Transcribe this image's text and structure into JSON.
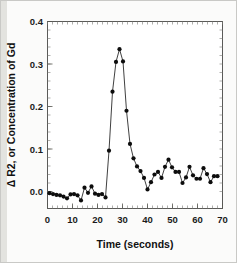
{
  "figure": {
    "background_color": "#fbfbfa",
    "border_color": "#c9c9c6",
    "gutter_color": "#e3e3df",
    "plot_background": "#ffffff"
  },
  "chart_data": {
    "type": "line",
    "title": "",
    "subtitle": "",
    "xlabel": "Time (seconds)",
    "ylabel": "Δ R2, or Concentration of Gd",
    "xlim": [
      0,
      70
    ],
    "ylim": [
      -0.04,
      0.4
    ],
    "xticks": [
      0,
      10,
      20,
      30,
      40,
      50,
      60,
      70
    ],
    "xticklabels": [
      "0",
      "10",
      "20",
      "30",
      "40",
      "50",
      "60",
      "70"
    ],
    "yticks": [
      0.0,
      0.1,
      0.2,
      0.3,
      0.4
    ],
    "yticklabels": [
      "0.0",
      "0.1",
      "0.2",
      "0.3",
      "0.4"
    ],
    "x_minor_tick_interval": 2,
    "y_minor_tick_interval": 0.02,
    "grid": true,
    "grid_axis": "y",
    "legend": false,
    "legend_position": "none",
    "marker": "circle",
    "marker_color": "#0d0d0d",
    "line_color": "#1d1d1d",
    "series": [
      {
        "name": "Δ R2 signal",
        "x": [
          0.8,
          2.2,
          3.6,
          5.0,
          6.4,
          7.8,
          9.2,
          10.6,
          12.0,
          13.4,
          14.8,
          16.2,
          17.6,
          19.0,
          20.4,
          21.8,
          23.2,
          24.6,
          26.0,
          27.4,
          28.8,
          30.2,
          31.6,
          33.0,
          34.4,
          35.8,
          37.2,
          38.6,
          40.0,
          41.4,
          42.8,
          44.2,
          45.6,
          47.0,
          48.4,
          49.8,
          51.2,
          52.6,
          54.0,
          55.4,
          56.8,
          58.2,
          59.6,
          61.0,
          62.4,
          63.8,
          65.2,
          66.6,
          68.0
        ],
        "y": [
          -0.004,
          -0.006,
          -0.008,
          -0.009,
          -0.012,
          -0.016,
          -0.007,
          -0.006,
          -0.009,
          -0.021,
          0.009,
          -0.003,
          0.012,
          -0.005,
          -0.008,
          -0.006,
          -0.014,
          0.096,
          0.235,
          0.305,
          0.335,
          0.306,
          0.19,
          0.112,
          0.078,
          0.059,
          0.048,
          0.032,
          0.005,
          0.022,
          0.04,
          0.046,
          0.032,
          0.058,
          0.075,
          0.057,
          0.046,
          0.046,
          0.02,
          0.033,
          0.058,
          0.038,
          0.03,
          0.03,
          0.055,
          0.041,
          0.022,
          0.036,
          0.036
        ]
      }
    ]
  }
}
